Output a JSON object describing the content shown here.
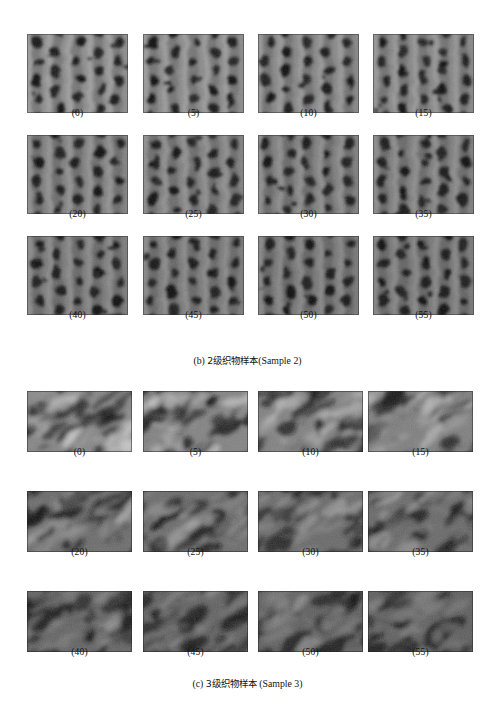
{
  "document": {
    "type": "figure-plate",
    "background_color": "#ffffff",
    "text_color": "#161616",
    "width": 495,
    "height": 724
  },
  "figures": [
    {
      "id": "figure-b",
      "caption": "(b) 2级织物样本(Sample 2)",
      "caption_parts": {
        "enumerator": "(b)",
        "chinese": "2级织物样本",
        "english": "(Sample 2)"
      },
      "grade": 2,
      "sample_number": 2,
      "caption_top": 330,
      "tile": {
        "width": 101,
        "height": 79
      },
      "tile_style": "vertical-rib-knit",
      "rows": [
        {
          "top": 10,
          "label_top": 83,
          "tiles": [
            {
              "label": "(0)",
              "value": 0,
              "left": 27,
              "seed": 11,
              "brightness": 0.62
            },
            {
              "label": "(5)",
              "value": 5,
              "left": 143,
              "seed": 12,
              "brightness": 0.6
            },
            {
              "label": "(10)",
              "value": 10,
              "left": 258,
              "seed": 13,
              "brightness": 0.58
            },
            {
              "label": "(15)",
              "value": 15,
              "left": 373,
              "seed": 14,
              "brightness": 0.57
            }
          ]
        },
        {
          "top": 111,
          "label_top": 184,
          "tiles": [
            {
              "label": "(20)",
              "value": 20,
              "left": 27,
              "seed": 21,
              "brightness": 0.54
            },
            {
              "label": "(25)",
              "value": 25,
              "left": 143,
              "seed": 22,
              "brightness": 0.53
            },
            {
              "label": "(30)",
              "value": 30,
              "left": 258,
              "seed": 23,
              "brightness": 0.52
            },
            {
              "label": "(35)",
              "value": 35,
              "left": 373,
              "seed": 24,
              "brightness": 0.51
            }
          ]
        },
        {
          "top": 212,
          "label_top": 285,
          "tiles": [
            {
              "label": "(40)",
              "value": 40,
              "left": 27,
              "seed": 31,
              "brightness": 0.5
            },
            {
              "label": "(45)",
              "value": 45,
              "left": 143,
              "seed": 32,
              "brightness": 0.49
            },
            {
              "label": "(50)",
              "value": 50,
              "left": 258,
              "seed": 33,
              "brightness": 0.48
            },
            {
              "label": "(55)",
              "value": 55,
              "left": 373,
              "seed": 34,
              "brightness": 0.47
            }
          ]
        }
      ]
    },
    {
      "id": "figure-c",
      "caption": "(c) 3级织物样本 (Sample 3)",
      "caption_parts": {
        "enumerator": "(c)",
        "chinese": "3级织物样本",
        "english": "(Sample 3)"
      },
      "grade": 3,
      "sample_number": 3,
      "caption_top": 296,
      "tile": {
        "width": 105,
        "height": 61
      },
      "tile_style": "blurred-fuzzy-pill",
      "rows": [
        {
          "top": 10,
          "label_top": 65,
          "tiles": [
            {
              "label": "(0)",
              "value": 0,
              "left": 27,
              "seed": 41,
              "brightness": 0.58
            },
            {
              "label": "(5)",
              "value": 5,
              "left": 143,
              "seed": 42,
              "brightness": 0.56
            },
            {
              "label": "(10)",
              "value": 10,
              "left": 258,
              "seed": 43,
              "brightness": 0.55
            },
            {
              "label": "(15)",
              "value": 15,
              "left": 368,
              "seed": 44,
              "brightness": 0.54
            }
          ]
        },
        {
          "top": 110,
          "label_top": 165,
          "tiles": [
            {
              "label": "(20)",
              "value": 20,
              "left": 27,
              "seed": 51,
              "brightness": 0.42
            },
            {
              "label": "(25)",
              "value": 25,
              "left": 143,
              "seed": 52,
              "brightness": 0.41
            },
            {
              "label": "(30)",
              "value": 30,
              "left": 258,
              "seed": 53,
              "brightness": 0.4
            },
            {
              "label": "(35)",
              "value": 35,
              "left": 368,
              "seed": 54,
              "brightness": 0.4
            }
          ]
        },
        {
          "top": 210,
          "label_top": 265,
          "tiles": [
            {
              "label": "(40)",
              "value": 40,
              "left": 27,
              "seed": 61,
              "brightness": 0.36
            },
            {
              "label": "(45)",
              "value": 45,
              "left": 143,
              "seed": 62,
              "brightness": 0.35
            },
            {
              "label": "(50)",
              "value": 50,
              "left": 258,
              "seed": 63,
              "brightness": 0.34
            },
            {
              "label": "(55)",
              "value": 55,
              "left": 368,
              "seed": 64,
              "brightness": 0.33
            }
          ]
        }
      ]
    }
  ]
}
